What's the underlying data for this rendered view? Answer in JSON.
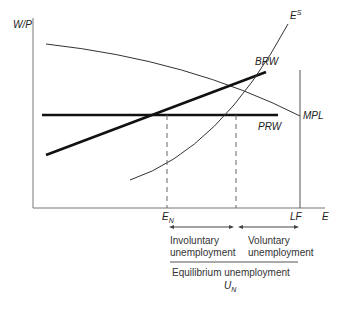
{
  "diagram": {
    "y_axis_label": "W/P",
    "x_axis_label": "E",
    "curves": {
      "mpl": {
        "label": "MPL"
      },
      "prw": {
        "label": "PRW"
      },
      "brw": {
        "label": "BRW"
      },
      "es": {
        "label": "E",
        "superscript": "S"
      }
    },
    "x_markers": {
      "en": {
        "label": "E",
        "subscript": "N"
      },
      "lf": {
        "label": "LF"
      }
    },
    "annotations": {
      "involuntary": {
        "line1": "Involuntary",
        "line2": "unemployment"
      },
      "voluntary": {
        "line1": "Voluntary",
        "line2": "unemployment"
      },
      "equilibrium": "Equilibrium unemployment",
      "un": {
        "label": "U",
        "subscript": "N"
      }
    }
  }
}
